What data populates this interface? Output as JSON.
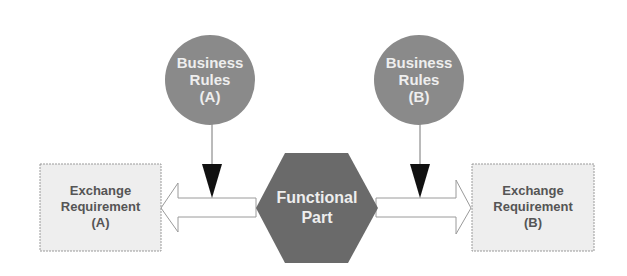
{
  "diagram": {
    "colors": {
      "circle_fill": "#8a8a8a",
      "hexagon_fill": "#6a6a6a",
      "box_fill": "#eeeeee",
      "box_border": "#9a9a9a",
      "arrow_fill": "#ffffff",
      "arrow_border": "#9a9a9a",
      "triangle_fill": "#111111"
    },
    "business_rules_a": {
      "line1": "Business",
      "line2": "Rules",
      "line3": "(A)"
    },
    "business_rules_b": {
      "line1": "Business",
      "line2": "Rules",
      "line3": "(B)"
    },
    "functional_part": {
      "line1": "Functional",
      "line2": "Part"
    },
    "exchange_requirement_a": {
      "line1": "Exchange",
      "line2": "Requirement",
      "line3": "(A)"
    },
    "exchange_requirement_b": {
      "line1": "Exchange",
      "line2": "Requirement",
      "line3": "(B)"
    }
  }
}
